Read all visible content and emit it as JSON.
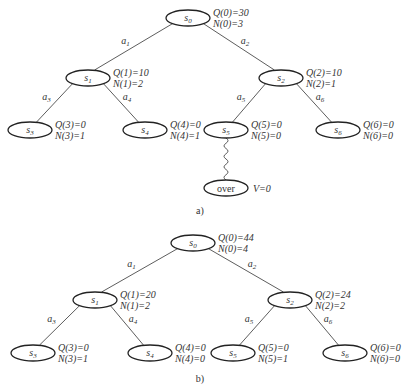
{
  "diagram_a": {
    "caption": "a)",
    "nodes": [
      {
        "id": "s0",
        "label": "s",
        "sub": "0",
        "x": 188,
        "y": 18,
        "q": "Q(0)=30",
        "n": "N(0)=3"
      },
      {
        "id": "s1",
        "label": "s",
        "sub": "1",
        "x": 88,
        "y": 78,
        "q": "Q(1)=10",
        "n": "N(1)=2"
      },
      {
        "id": "s2",
        "label": "s",
        "sub": "2",
        "x": 281,
        "y": 78,
        "q": "Q(2)=10",
        "n": "N(2)=1"
      },
      {
        "id": "s3",
        "label": "s",
        "sub": "3",
        "x": 30,
        "y": 130,
        "q": "Q(3)=0",
        "n": "N(3)=1"
      },
      {
        "id": "s4",
        "label": "s",
        "sub": "4",
        "x": 145,
        "y": 130,
        "q": "Q(4)=0",
        "n": "N(4)=1"
      },
      {
        "id": "s5",
        "label": "s",
        "sub": "5",
        "x": 226,
        "y": 130,
        "q": "Q(5)=0",
        "n": "N(5)=0"
      },
      {
        "id": "s6",
        "label": "s",
        "sub": "6",
        "x": 338,
        "y": 130,
        "q": "Q(6)=0",
        "n": "N(6)=0"
      }
    ],
    "edges": [
      {
        "from": "s0",
        "to": "s1",
        "action": "a",
        "sub": "1"
      },
      {
        "from": "s0",
        "to": "s2",
        "action": "a",
        "sub": "2"
      },
      {
        "from": "s1",
        "to": "s3",
        "action": "a",
        "sub": "3"
      },
      {
        "from": "s1",
        "to": "s4",
        "action": "a",
        "sub": "4"
      },
      {
        "from": "s2",
        "to": "s5",
        "action": "a",
        "sub": "5"
      },
      {
        "from": "s2",
        "to": "s6",
        "action": "a",
        "sub": "6"
      }
    ],
    "rollout": {
      "from": "s5",
      "terminal_label": "over",
      "value": "V=0"
    }
  },
  "diagram_b": {
    "caption": "b)",
    "nodes": [
      {
        "id": "s0",
        "label": "s",
        "sub": "0",
        "x": 193,
        "y": 243,
        "q": "Q(0)=44",
        "n": "N(0)=4"
      },
      {
        "id": "s1",
        "label": "s",
        "sub": "1",
        "x": 95,
        "y": 300,
        "q": "Q(1)=20",
        "n": "N(1)=2"
      },
      {
        "id": "s2",
        "label": "s",
        "sub": "2",
        "x": 290,
        "y": 300,
        "q": "Q(2)=24",
        "n": "N(2)=2"
      },
      {
        "id": "s3",
        "label": "s",
        "sub": "3",
        "x": 33,
        "y": 353,
        "q": "Q(3)=0",
        "n": "N(3)=1"
      },
      {
        "id": "s4",
        "label": "s",
        "sub": "4",
        "x": 150,
        "y": 353,
        "q": "Q(4)=0",
        "n": "N(4)=0"
      },
      {
        "id": "s5",
        "label": "s",
        "sub": "5",
        "x": 233,
        "y": 353,
        "q": "Q(5)=0",
        "n": "N(5)=1"
      },
      {
        "id": "s6",
        "label": "s",
        "sub": "6",
        "x": 345,
        "y": 353,
        "q": "Q(6)=0",
        "n": "N(6)=0"
      }
    ],
    "edges": [
      {
        "from": "s0",
        "to": "s1",
        "action": "a",
        "sub": "1"
      },
      {
        "from": "s0",
        "to": "s2",
        "action": "a",
        "sub": "2"
      },
      {
        "from": "s1",
        "to": "s3",
        "action": "a",
        "sub": "3"
      },
      {
        "from": "s1",
        "to": "s4",
        "action": "a",
        "sub": "4"
      },
      {
        "from": "s2",
        "to": "s5",
        "action": "a",
        "sub": "5"
      },
      {
        "from": "s2",
        "to": "s6",
        "action": "a",
        "sub": "6"
      }
    ]
  }
}
